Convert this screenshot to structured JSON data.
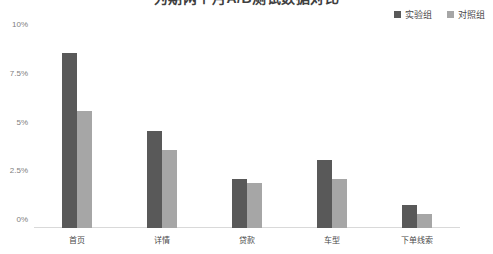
{
  "chart_data": {
    "type": "bar",
    "title": "为期两个月A/B测试数据对比",
    "xlabel": "",
    "ylabel": "",
    "ylim": [
      0,
      10
    ],
    "yticks": [
      "0%",
      "2.5%",
      "5%",
      "7.5%",
      "10%"
    ],
    "ytick_values": [
      0,
      2.5,
      5,
      7.5,
      10
    ],
    "grid": false,
    "legend_position": "top-right",
    "categories": [
      "首页",
      "详情",
      "贷款",
      "车型",
      "下单线索"
    ],
    "series": [
      {
        "name": "实验组",
        "color": "#595959",
        "values": [
          9.0,
          5.0,
          2.5,
          3.5,
          1.2
        ]
      },
      {
        "name": "对照组",
        "color": "#a6a6a6",
        "values": [
          6.0,
          4.0,
          2.3,
          2.5,
          0.7
        ]
      }
    ]
  },
  "colors": {
    "series_a": "#595959",
    "series_b": "#a6a6a6",
    "axis": "#d9d9d9",
    "tick_text": "#808080",
    "label_text": "#4a4a4a"
  }
}
